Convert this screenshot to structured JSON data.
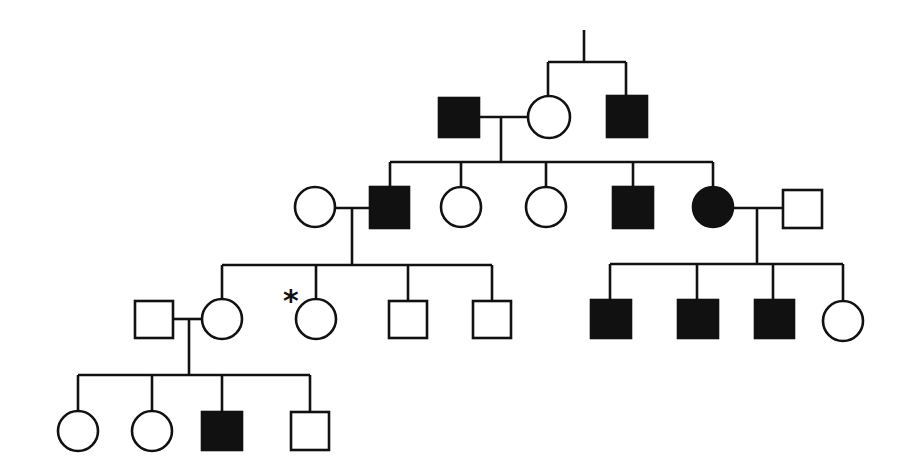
{
  "diagram": {
    "type": "pedigree",
    "legend": {
      "square": "male",
      "circle": "female",
      "filled": "affected",
      "open": "unaffected",
      "asterisk": "marked individual (proband/consultand)"
    },
    "colors": {
      "affected": "#111111",
      "unaffected": "#ffffff",
      "line": "#111111"
    },
    "generations": [
      {
        "id": "I",
        "individuals": [
          {
            "id": "I-1",
            "sex": "male",
            "affected": true,
            "note": "spouse"
          },
          {
            "id": "I-2",
            "sex": "female",
            "affected": false
          },
          {
            "id": "I-3",
            "sex": "male",
            "affected": true,
            "note": "brother of I-2"
          }
        ]
      },
      {
        "id": "II",
        "individuals": [
          {
            "id": "II-1",
            "sex": "female",
            "affected": false,
            "note": "spouse of II-2"
          },
          {
            "id": "II-2",
            "sex": "male",
            "affected": true
          },
          {
            "id": "II-3",
            "sex": "female",
            "affected": false
          },
          {
            "id": "II-4",
            "sex": "female",
            "affected": false
          },
          {
            "id": "II-5",
            "sex": "male",
            "affected": true
          },
          {
            "id": "II-6",
            "sex": "female",
            "affected": true
          },
          {
            "id": "II-7",
            "sex": "male",
            "affected": false,
            "note": "spouse of II-6"
          }
        ]
      },
      {
        "id": "III",
        "individuals": [
          {
            "id": "III-1",
            "sex": "male",
            "affected": false,
            "note": "spouse of III-2"
          },
          {
            "id": "III-2",
            "sex": "female",
            "affected": false
          },
          {
            "id": "III-3",
            "sex": "female",
            "affected": false,
            "marker": "*"
          },
          {
            "id": "III-4",
            "sex": "male",
            "affected": false
          },
          {
            "id": "III-5",
            "sex": "male",
            "affected": false
          },
          {
            "id": "III-6",
            "sex": "male",
            "affected": true
          },
          {
            "id": "III-7",
            "sex": "male",
            "affected": true
          },
          {
            "id": "III-8",
            "sex": "male",
            "affected": true
          },
          {
            "id": "III-9",
            "sex": "female",
            "affected": false
          }
        ]
      },
      {
        "id": "IV",
        "individuals": [
          {
            "id": "IV-1",
            "sex": "female",
            "affected": false
          },
          {
            "id": "IV-2",
            "sex": "female",
            "affected": false
          },
          {
            "id": "IV-3",
            "sex": "male",
            "affected": true
          },
          {
            "id": "IV-4",
            "sex": "male",
            "affected": false
          }
        ]
      }
    ],
    "asterisk_label": "*"
  }
}
